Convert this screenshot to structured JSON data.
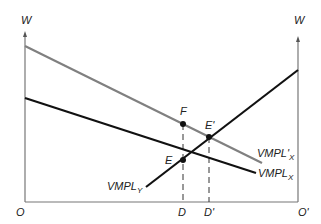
{
  "diagram": {
    "axes": {
      "left_axis_label": "W",
      "right_axis_label": "W",
      "origin_left": "O",
      "origin_right": "O'"
    },
    "curves": [
      {
        "id": "vmpl_x_prime",
        "label_main": "VMPL'",
        "label_sub": "X",
        "color": "#808080",
        "from": [
          25,
          46
        ],
        "to": [
          262,
          163
        ]
      },
      {
        "id": "vmpl_x",
        "label_main": "VMPL",
        "label_sub": "X",
        "color": "#111111",
        "from": [
          25,
          98
        ],
        "to": [
          256,
          173
        ]
      },
      {
        "id": "vmpl_y",
        "label_main": "VMPL",
        "label_sub": "Y",
        "color": "#111111",
        "from": [
          146,
          187
        ],
        "to": [
          298,
          70
        ]
      }
    ],
    "points": [
      {
        "id": "E",
        "label": "E",
        "x": 183,
        "y": 160
      },
      {
        "id": "E_prime",
        "label": "E'",
        "x": 209,
        "y": 137
      },
      {
        "id": "F",
        "label": "F",
        "x": 183,
        "y": 124
      }
    ],
    "x_markers": [
      {
        "id": "D",
        "label": "D",
        "x": 183
      },
      {
        "id": "D_prime",
        "label": "D'",
        "x": 209
      }
    ],
    "colors": {
      "axis": "#777777",
      "black_line": "#111111",
      "gray_line": "#808080"
    }
  }
}
